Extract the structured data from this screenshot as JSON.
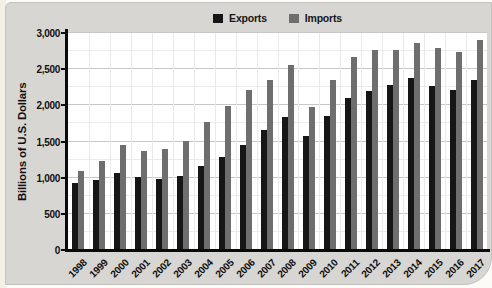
{
  "chart_data": {
    "type": "bar",
    "title": "",
    "xlabel": "",
    "ylabel": "Billions of U.S. Dollars",
    "ylim": [
      0,
      3000
    ],
    "y_tick_step": 500,
    "y_minor_step": 250,
    "y_tick_labels": [
      "0",
      "500",
      "1,000",
      "1,500",
      "2,000",
      "2,500",
      "3,000"
    ],
    "grid": true,
    "legend_position": "top-center",
    "categories": [
      "1998",
      "1999",
      "2000",
      "2001",
      "2002",
      "2003",
      "2004",
      "2005",
      "2006",
      "2007",
      "2008",
      "2009",
      "2010",
      "2011",
      "2012",
      "2013",
      "2014",
      "2015",
      "2016",
      "2017"
    ],
    "series": [
      {
        "name": "Exports",
        "color": "#161616",
        "values": [
          933,
          966,
          1071,
          1005,
          975,
          1017,
          1157,
          1283,
          1457,
          1653,
          1841,
          1583,
          1853,
          2106,
          2198,
          2277,
          2375,
          2264,
          2214,
          2351
        ]
      },
      {
        "name": "Imports",
        "color": "#6e6e6e",
        "values": [
          1099,
          1231,
          1450,
          1369,
          1398,
          1514,
          1769,
          1996,
          2212,
          2345,
          2556,
          1976,
          2348,
          2675,
          2763,
          2770,
          2866,
          2786,
          2735,
          2903
        ]
      }
    ]
  }
}
